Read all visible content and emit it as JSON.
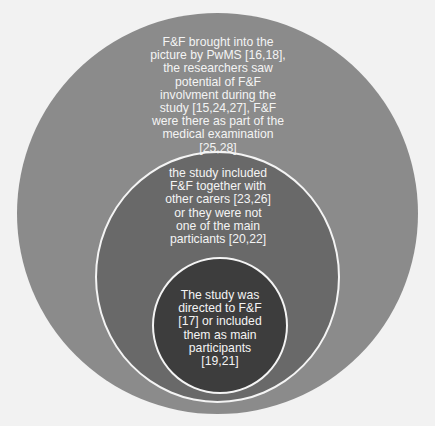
{
  "diagram": {
    "type": "nested-circles",
    "colors": {
      "background": "#f2f2f2",
      "outer_circle": "#8b8b8b",
      "middle_circle": "#696969",
      "inner_circle": "#3d3d3d",
      "border": "#f4f4f4",
      "text": "#f4f4f4"
    },
    "levels": [
      {
        "level": "outer",
        "text": "F&F brought into the\npicture by PwMS [16,18],\nthe researchers saw\npotential of F&F\ninvolvment during the\nstudy [15,24,27], F&F\nwere there as part of the\nmedical examination\n[25,28]"
      },
      {
        "level": "middle",
        "text": "the study included\nF&F together with\nother carers [23,26]\nor they were not\none of the main\nparticiants [20,22]"
      },
      {
        "level": "inner",
        "text": "The study was\ndirected to F&F\n[17] or included\nthem as main\nparticipants\n[19,21]"
      }
    ]
  }
}
